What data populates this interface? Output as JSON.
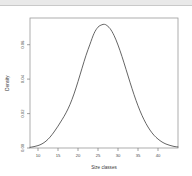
{
  "figure": {
    "background_color": "#ffffff",
    "frame_color": "#9a9a9a",
    "curve_color": "#3d3d3d",
    "tick_color": "#7a7a7a",
    "text_color": "#4a4a4a",
    "top_band_color": "#e9e9e9"
  },
  "chart_data": {
    "type": "line",
    "title": "",
    "subtitle": "",
    "xlabel": "Size classes",
    "ylabel": "Density",
    "xlim": [
      8.0,
      45.0
    ],
    "ylim": [
      0.0,
      0.0755
    ],
    "grid": false,
    "legend": null,
    "xticks": [
      10,
      15,
      20,
      25,
      30,
      35,
      40
    ],
    "xticklabels": [
      "10",
      "15",
      "20",
      "25",
      "30",
      "35",
      "40"
    ],
    "yticks": [
      0.0,
      0.02,
      0.04,
      0.06
    ],
    "yticklabels": [
      "0.00",
      "0.02",
      "0.04",
      "0.06"
    ],
    "annotations": [],
    "series": [
      {
        "name": "Density",
        "peak_x": 26.5,
        "peak_y": 0.0718,
        "x": [
          8.0,
          9.0,
          10.0,
          11.0,
          12.0,
          13.0,
          14.0,
          15.0,
          16.0,
          17.0,
          18.0,
          19.0,
          20.0,
          21.0,
          22.0,
          23.0,
          24.0,
          25.0,
          26.0,
          26.5,
          27.0,
          28.0,
          29.0,
          30.0,
          31.0,
          32.0,
          33.0,
          34.0,
          35.0,
          36.0,
          37.0,
          38.0,
          39.0,
          40.0,
          41.0,
          42.0,
          43.0,
          44.0,
          45.0
        ],
        "y": [
          0.0004,
          0.0008,
          0.0014,
          0.0024,
          0.004,
          0.0063,
          0.0093,
          0.0127,
          0.0164,
          0.0204,
          0.0253,
          0.0314,
          0.0386,
          0.0463,
          0.0538,
          0.0603,
          0.0665,
          0.0702,
          0.0716,
          0.0718,
          0.0715,
          0.0694,
          0.0654,
          0.0598,
          0.0531,
          0.0457,
          0.0382,
          0.031,
          0.0245,
          0.0189,
          0.0142,
          0.0104,
          0.0074,
          0.0052,
          0.0035,
          0.0023,
          0.0015,
          0.0009,
          0.0006
        ]
      }
    ]
  }
}
